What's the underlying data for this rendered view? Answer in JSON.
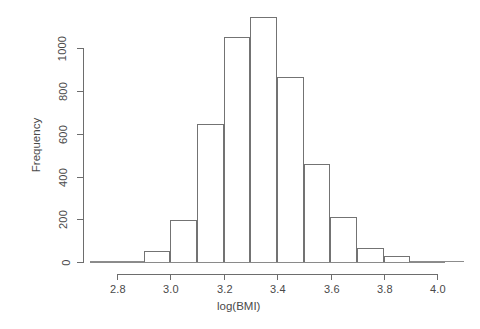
{
  "chart_data": {
    "type": "bar",
    "title": "",
    "subtitle": "",
    "xlabel": "log(BMI)",
    "ylabel": "Frequency",
    "xlim": [
      2.7,
      4.1
    ],
    "ylim": [
      0,
      1150
    ],
    "grid": false,
    "legend": null,
    "bin_width": 0.1,
    "bin_edges": [
      2.7,
      2.8,
      2.9,
      3.0,
      3.1,
      3.2,
      3.3,
      3.4,
      3.5,
      3.6,
      3.7,
      3.8,
      3.9,
      4.0,
      4.1
    ],
    "categories": [
      "2.7-2.8",
      "2.8-2.9",
      "2.9-3.0",
      "3.0-3.1",
      "3.1-3.2",
      "3.2-3.3",
      "3.3-3.4",
      "3.4-3.5",
      "3.5-3.6",
      "3.6-3.7",
      "3.7-3.8",
      "3.8-3.9",
      "3.9-4.0",
      "4.0-4.1"
    ],
    "values": [
      0,
      2,
      50,
      198,
      645,
      1050,
      1145,
      865,
      460,
      212,
      65,
      30,
      5,
      2
    ],
    "x_ticks": [
      2.8,
      3.0,
      3.2,
      3.4,
      3.6,
      3.8,
      4.0
    ],
    "x_tick_labels": [
      "2.8",
      "3.0",
      "3.2",
      "3.4",
      "3.6",
      "3.8",
      "4.0"
    ],
    "y_ticks": [
      0,
      200,
      400,
      600,
      800,
      1000
    ],
    "y_tick_labels": [
      "0",
      "200",
      "400",
      "600",
      "800",
      "1000"
    ]
  },
  "style": {
    "axis_color": "#6d6d6d",
    "bar_border_color": "#737373",
    "bar_fill": "transparent",
    "text_color": "#4a4a4a",
    "background": "#ffffff"
  }
}
